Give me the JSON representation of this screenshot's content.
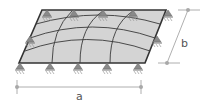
{
  "diagram": {
    "dimension_a": {
      "label": "a"
    },
    "dimension_b": {
      "label": "b"
    },
    "colors": {
      "plate_fill": "#d4d4d4",
      "plate_edge": "#333333",
      "grid_lines": "#3a3a3a",
      "support": "#8a8a8a",
      "dimension": "#9a9a9a",
      "text": "#555555"
    },
    "supports": {
      "top_count": 5,
      "bottom_count": 5,
      "left_count": 1,
      "right_count": 1
    }
  }
}
